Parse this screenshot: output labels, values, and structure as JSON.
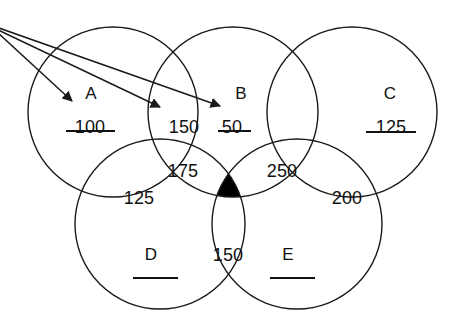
{
  "diagram": {
    "type": "venn",
    "stroke_color": "#1a1a1a",
    "fill_color": "#ffffff",
    "shaded_color": "#000000",
    "text_color": "#111111",
    "sets": [
      {
        "id": "A",
        "label": "A",
        "cx": 113,
        "cy": 112,
        "r": 85
      },
      {
        "id": "B",
        "label": "B",
        "cx": 233,
        "cy": 112,
        "r": 85
      },
      {
        "id": "C",
        "label": "C",
        "cx": 352,
        "cy": 112,
        "r": 85
      },
      {
        "id": "D",
        "label": "D",
        "cx": 160,
        "cy": 224,
        "r": 85
      },
      {
        "id": "E",
        "label": "E",
        "cx": 297,
        "cy": 224,
        "r": 85
      }
    ],
    "set_letters": [
      {
        "name": "set-label-a",
        "text": "A",
        "x": 91,
        "y": 84
      },
      {
        "name": "set-label-b",
        "text": "B",
        "x": 241,
        "y": 84
      },
      {
        "name": "set-label-c",
        "text": "C",
        "x": 390,
        "y": 84
      },
      {
        "name": "set-label-d",
        "text": "D",
        "x": 151,
        "y": 245
      },
      {
        "name": "set-label-e",
        "text": "E",
        "x": 288,
        "y": 245
      }
    ],
    "regions": [
      {
        "name": "region-a-only",
        "value": "100",
        "x": 90,
        "y": 117,
        "underline": true,
        "ul_x": 66,
        "ul_y": 130,
        "ul_w": 49
      },
      {
        "name": "region-a-b",
        "value": "150",
        "x": 184,
        "y": 117,
        "underline": false,
        "ul_x": 0,
        "ul_y": 0,
        "ul_w": 0
      },
      {
        "name": "region-b-only",
        "value": "50",
        "x": 232,
        "y": 117,
        "underline": true,
        "ul_x": 218,
        "ul_y": 130,
        "ul_w": 33
      },
      {
        "name": "region-c-only",
        "value": "125",
        "x": 391,
        "y": 117,
        "underline": true,
        "ul_x": 366,
        "ul_y": 131,
        "ul_w": 50
      },
      {
        "name": "region-a-b-d",
        "value": "175",
        "x": 183,
        "y": 161,
        "underline": false,
        "ul_x": 0,
        "ul_y": 0,
        "ul_w": 0
      },
      {
        "name": "region-b-c-e",
        "value": "250",
        "x": 282,
        "y": 161,
        "underline": false,
        "ul_x": 0,
        "ul_y": 0,
        "ul_w": 0
      },
      {
        "name": "region-a-d",
        "value": "125",
        "x": 139,
        "y": 188,
        "underline": false,
        "ul_x": 0,
        "ul_y": 0,
        "ul_w": 0
      },
      {
        "name": "region-c-e",
        "value": "200",
        "x": 347,
        "y": 188,
        "underline": false,
        "ul_x": 0,
        "ul_y": 0,
        "ul_w": 0
      },
      {
        "name": "region-d-e",
        "value": "150",
        "x": 228,
        "y": 245,
        "underline": false,
        "ul_x": 0,
        "ul_y": 0,
        "ul_w": 0
      }
    ],
    "blank_rules": [
      {
        "name": "blank-answer-line-d",
        "x": 133,
        "y": 277,
        "w": 45
      },
      {
        "name": "blank-answer-line-e",
        "x": 270,
        "y": 277,
        "w": 45
      }
    ],
    "shaded_region": {
      "name": "shaded-intersection",
      "description": "black filled central intersection region",
      "color": "#000000"
    },
    "arrows": [
      {
        "name": "arrow-to-region-a-only",
        "x1": -4,
        "y1": 31,
        "x2": 72,
        "y2": 101
      },
      {
        "name": "arrow-to-region-a-b",
        "x1": -4,
        "y1": 29,
        "x2": 160,
        "y2": 107
      },
      {
        "name": "arrow-to-region-b-only",
        "x1": -4,
        "y1": 27,
        "x2": 220,
        "y2": 106
      }
    ]
  }
}
